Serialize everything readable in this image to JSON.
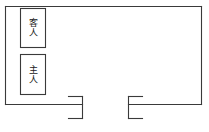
{
  "diagram": {
    "type": "seating-floor-plan",
    "stroke_color": "#3a3a3a",
    "background_color": "#ffffff",
    "room": {
      "name": "room-outline",
      "x": 5,
      "y": 6,
      "width": 197,
      "height": 99
    },
    "seats": [
      {
        "name": "seat-box-guest",
        "label": "客人",
        "label_chars": [
          "客",
          "人"
        ],
        "meaning": "Guest",
        "x": 20,
        "y": 8,
        "width": 26,
        "height": 40
      },
      {
        "name": "seat-box-host",
        "label": "主人",
        "label_chars": [
          "主",
          "人"
        ],
        "meaning": "Host",
        "x": 20,
        "y": 54,
        "width": 26,
        "height": 41
      }
    ],
    "doorway": {
      "name": "doorway-opening",
      "gap_start_x": 82,
      "gap_end_x": 128,
      "left_jamb": {
        "name": "door-jamb-left",
        "top_y": 97,
        "bottom_y": 118,
        "x": 82,
        "flange_x": 68
      },
      "right_jamb": {
        "name": "door-jamb-right",
        "top_y": 97,
        "bottom_y": 118,
        "x": 128,
        "flange_x": 142
      }
    }
  }
}
